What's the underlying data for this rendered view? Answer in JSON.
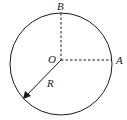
{
  "diagram": {
    "type": "circle-geometry",
    "labels": {
      "center": "O",
      "point_a": "A",
      "point_b": "B",
      "radius": "R"
    },
    "colors": {
      "stroke": "#1a1a1a",
      "background": "#ffffff"
    }
  }
}
